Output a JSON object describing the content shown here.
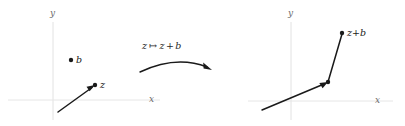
{
  "figure": {
    "width": 405,
    "height": 126,
    "background_color": "#ffffff",
    "stroke_color": "#1a1a1a",
    "axis_color": "#9a9a9a",
    "axis_label_color": "#6b6b6b"
  },
  "left_panel": {
    "name": "source-plane",
    "y_axis_label": "y",
    "x_axis_label": "x",
    "point_b_label": "b",
    "point_z_label": "z",
    "vector_z": {
      "tail": [
        58,
        112
      ],
      "head": [
        95,
        85
      ]
    },
    "point_b": [
      71,
      60
    ],
    "point_z": [
      95,
      85
    ]
  },
  "map_arrow": {
    "name": "mapping-arrow",
    "label_z": "z",
    "label_mapsto": "↦",
    "label_result_z": "z",
    "label_plus": "+",
    "label_result_b": "b",
    "full_label": "z ↦ z + b",
    "arc_start": [
      140,
      72
    ],
    "arc_end": [
      211,
      69
    ],
    "arc_peak": [
      176,
      59
    ]
  },
  "right_panel": {
    "name": "target-plane",
    "y_axis_label": "y",
    "x_axis_label": "x",
    "point_label": "z + b",
    "label_z": "z",
    "label_plus": "+",
    "label_b": "b",
    "vector_z_translated": {
      "tail": [
        262,
        110
      ],
      "head": [
        328,
        82
      ]
    },
    "segment_b": {
      "start": [
        328,
        82
      ],
      "end": [
        342,
        33
      ]
    },
    "point_sum": [
      342,
      33
    ]
  }
}
